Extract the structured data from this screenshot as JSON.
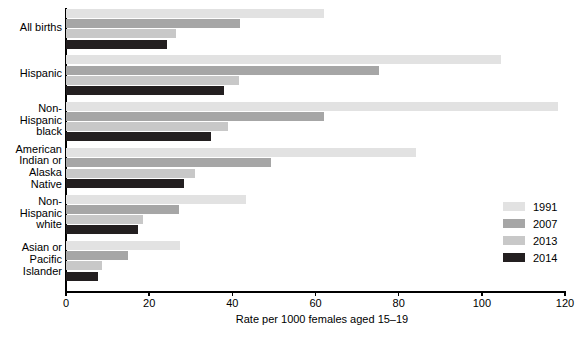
{
  "chart_data": {
    "type": "bar",
    "orientation": "horizontal",
    "title": "",
    "xlabel": "Rate per 1000 females aged 15–19",
    "ylabel": "",
    "xlim": [
      0,
      120
    ],
    "xticks": [
      0,
      20,
      40,
      60,
      80,
      100,
      120
    ],
    "grid": false,
    "legend_position": "right",
    "categories": [
      "All births",
      "Hispanic",
      "Non-\nHispanic\nblack",
      "American\nIndian or\nAlaska\nNative",
      "Non-\nHispanic\nwhite",
      "Asian or\nPacific\nIslander"
    ],
    "category_lines": [
      [
        "All births"
      ],
      [
        "Hispanic"
      ],
      [
        "Non-",
        "Hispanic",
        "black"
      ],
      [
        "American",
        "Indian or",
        "Alaska",
        "Native"
      ],
      [
        "Non-",
        "Hispanic",
        "white"
      ],
      [
        "Asian or",
        "Pacific",
        "Islander"
      ]
    ],
    "series": [
      {
        "name": "1991",
        "color": "#e2e2e2",
        "values": [
          62.1,
          104.6,
          118.2,
          84.1,
          43.4,
          27.3
        ]
      },
      {
        "name": "2007",
        "color": "#a6a6a6",
        "values": [
          41.9,
          75.3,
          62.0,
          49.3,
          27.2,
          15.0
        ]
      },
      {
        "name": "2013",
        "color": "#c8c8c8",
        "values": [
          26.5,
          41.7,
          39.0,
          31.1,
          18.6,
          8.7
        ]
      },
      {
        "name": "2014",
        "color": "#231f20",
        "values": [
          24.2,
          38.0,
          34.9,
          28.3,
          17.3,
          7.7
        ]
      }
    ]
  },
  "axis": {
    "x_title": "Rate per 1000 females aged 15–19",
    "tick_labels": [
      "0",
      "20",
      "40",
      "60",
      "80",
      "100",
      "120"
    ]
  },
  "legend": {
    "items": [
      {
        "label": "1991",
        "color": "#e2e2e2"
      },
      {
        "label": "2007",
        "color": "#a6a6a6"
      },
      {
        "label": "2013",
        "color": "#c8c8c8"
      },
      {
        "label": "2014",
        "color": "#231f20"
      }
    ]
  },
  "footnote": {
    "text": ""
  }
}
